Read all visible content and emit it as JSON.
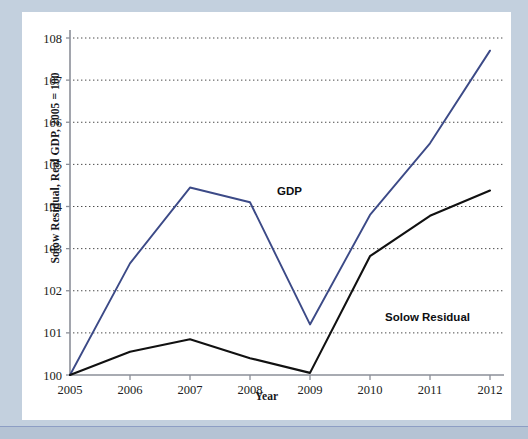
{
  "figure": {
    "y_axis_title": "Solow Residual, Real GDP, 2005 = 100",
    "x_axis_title": "Year"
  },
  "chart_data": {
    "type": "line",
    "title": "",
    "xlabel": "Year",
    "ylabel": "Solow Residual, Real GDP, 2005 = 100",
    "x": [
      2005,
      2006,
      2007,
      2008,
      2009,
      2010,
      2011,
      2012
    ],
    "xtick_labels": [
      "2005",
      "2006",
      "2007",
      "2008",
      "2009",
      "2010",
      "2011",
      "2012"
    ],
    "ytick_labels": [
      "100",
      "101",
      "102",
      "103",
      "104",
      "105",
      "106",
      "107",
      "108"
    ],
    "yticks": [
      100,
      101,
      102,
      103,
      104,
      105,
      106,
      107,
      108
    ],
    "xlim": [
      2005,
      2012
    ],
    "ylim": [
      100,
      108
    ],
    "grid": "horizontal-dotted",
    "legend_position": "inline-annotations",
    "series": [
      {
        "name": "GDP",
        "color": "#3c4a87",
        "label_x": 2008.45,
        "label_y": 104.28,
        "values": [
          100.0,
          102.65,
          104.45,
          104.1,
          101.2,
          103.8,
          105.5,
          107.7
        ]
      },
      {
        "name": "Solow Residual",
        "color": "#111111",
        "label_x": 2010.25,
        "label_y": 101.28,
        "values": [
          100.0,
          100.55,
          100.85,
          100.4,
          100.05,
          102.82,
          103.78,
          104.38
        ]
      }
    ]
  }
}
